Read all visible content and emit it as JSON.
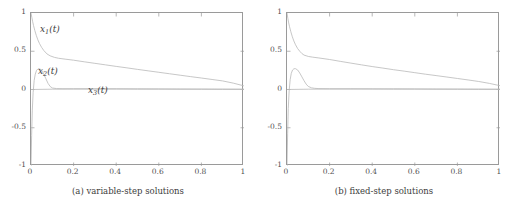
{
  "figure": {
    "background": "#ffffff",
    "axis_color": "#9a9a9a",
    "curve_color": "#b9b9b9",
    "text_color": "#3d3d3d"
  },
  "panels": [
    {
      "id": "panel-a",
      "caption": "(a) variable-step solutions",
      "annotations": [
        {
          "name": "curve-label-x1",
          "base": "x",
          "sub": "1",
          "tail": "(t)",
          "left": 40,
          "top": 24
        },
        {
          "name": "curve-label-x2",
          "base": "x",
          "sub": "2",
          "tail": "(t)",
          "left": 38,
          "top": 66
        },
        {
          "name": "curve-label-x3",
          "base": "x",
          "sub": "3",
          "tail": "(t)",
          "left": 88,
          "top": 85
        }
      ]
    },
    {
      "id": "panel-b",
      "caption": "(b) fixed-step solutions",
      "annotations": []
    }
  ],
  "axes": {
    "xlabel": "",
    "ylabel": "",
    "xlim": [
      0,
      1
    ],
    "ylim": [
      -1,
      1
    ],
    "xticks": [
      "0",
      "0.2",
      "0.4",
      "0.6",
      "0.8",
      "1"
    ],
    "xtick_values": [
      0,
      0.2,
      0.4,
      0.6,
      0.8,
      1
    ],
    "yticks": [
      "1",
      "0.5",
      "0",
      "-0.5",
      "-1"
    ],
    "ytick_values": [
      1,
      0.5,
      0,
      -0.5,
      -1
    ],
    "grid": false,
    "legend": "none"
  },
  "chart_data": [
    {
      "type": "line",
      "title": "(a) variable-step solutions",
      "xlabel": "",
      "ylabel": "",
      "xlim": [
        0,
        1
      ],
      "ylim": [
        -1,
        1
      ],
      "xticks": [
        0,
        0.2,
        0.4,
        0.6,
        0.8,
        1
      ],
      "yticks": [
        -1,
        -0.5,
        0,
        0.5,
        1
      ],
      "grid": false,
      "legend": "inline-labels",
      "series": [
        {
          "name": "x1(t)",
          "x": [
            0,
            0.004,
            0.008,
            0.012,
            0.018,
            0.025,
            0.032,
            0.04,
            0.05,
            0.06,
            0.075,
            0.09,
            0.11,
            0.13,
            0.16,
            0.2,
            0.25,
            0.3,
            0.35,
            0.4,
            0.45,
            0.5,
            0.55,
            0.6,
            0.65,
            0.7,
            0.75,
            0.8,
            0.85,
            0.9,
            0.95,
            1
          ],
          "y": [
            1.0,
            0.94,
            0.885,
            0.835,
            0.77,
            0.705,
            0.65,
            0.6,
            0.55,
            0.51,
            0.465,
            0.44,
            0.42,
            0.408,
            0.397,
            0.383,
            0.362,
            0.342,
            0.322,
            0.302,
            0.283,
            0.263,
            0.244,
            0.225,
            0.206,
            0.187,
            0.168,
            0.15,
            0.131,
            0.112,
            0.083,
            0.047
          ]
        },
        {
          "name": "x2(t)",
          "x": [
            0,
            0.003,
            0.006,
            0.01,
            0.015,
            0.02,
            0.026,
            0.033,
            0.04,
            0.045,
            0.05,
            0.06,
            0.07,
            0.08,
            0.09,
            0.1,
            0.12,
            0.15,
            0.2,
            0.3,
            0.4,
            0.5,
            0.6,
            0.7,
            0.8,
            0.9,
            1
          ],
          "y": [
            -1.0,
            -0.6,
            -0.28,
            -0.04,
            0.12,
            0.2,
            0.25,
            0.27,
            0.27,
            0.265,
            0.25,
            0.2,
            0.14,
            0.08,
            0.04,
            0.02,
            0.012,
            0.01,
            0.01,
            0.01,
            0.01,
            0.009,
            0.008,
            0.007,
            0.006,
            0.005,
            0.004
          ]
        },
        {
          "name": "x3(t)",
          "x": [
            0,
            0.1,
            0.2,
            0.3,
            0.4,
            0.5,
            0.6,
            0.7,
            0.8,
            0.9,
            1
          ],
          "y": [
            0.0,
            0.004,
            0.005,
            0.005,
            0.005,
            0.004,
            0.004,
            0.003,
            0.003,
            0.002,
            0.002
          ]
        }
      ]
    },
    {
      "type": "line",
      "title": "(b) fixed-step solutions",
      "xlabel": "",
      "ylabel": "",
      "xlim": [
        0,
        1
      ],
      "ylim": [
        -1,
        1
      ],
      "xticks": [
        0,
        0.2,
        0.4,
        0.6,
        0.8,
        1
      ],
      "yticks": [
        -1,
        -0.5,
        0,
        0.5,
        1
      ],
      "grid": false,
      "legend": "none",
      "series": [
        {
          "name": "x1(t)",
          "x": [
            0,
            0.004,
            0.008,
            0.012,
            0.018,
            0.025,
            0.032,
            0.04,
            0.05,
            0.06,
            0.07,
            0.08,
            0.1,
            0.12,
            0.15,
            0.2,
            0.25,
            0.3,
            0.35,
            0.4,
            0.45,
            0.5,
            0.55,
            0.6,
            0.65,
            0.7,
            0.75,
            0.8,
            0.85,
            0.9,
            0.95,
            1
          ],
          "y": [
            1.0,
            0.93,
            0.87,
            0.82,
            0.755,
            0.69,
            0.635,
            0.585,
            0.535,
            0.5,
            0.47,
            0.45,
            0.432,
            0.423,
            0.412,
            0.392,
            0.368,
            0.345,
            0.322,
            0.3,
            0.28,
            0.259,
            0.24,
            0.22,
            0.2,
            0.182,
            0.163,
            0.144,
            0.125,
            0.105,
            0.08,
            0.05
          ]
        },
        {
          "name": "x2(t)",
          "x": [
            0,
            0.003,
            0.006,
            0.01,
            0.015,
            0.02,
            0.026,
            0.033,
            0.04,
            0.05,
            0.06,
            0.07,
            0.08,
            0.09,
            0.1,
            0.115,
            0.13,
            0.15,
            0.2,
            0.3,
            0.4,
            0.5,
            0.6,
            0.7,
            0.8,
            0.9,
            1
          ],
          "y": [
            -1.0,
            -0.58,
            -0.25,
            -0.02,
            0.13,
            0.21,
            0.255,
            0.272,
            0.272,
            0.255,
            0.215,
            0.165,
            0.115,
            0.07,
            0.04,
            0.022,
            0.015,
            0.012,
            0.01,
            0.01,
            0.009,
            0.009,
            0.008,
            0.007,
            0.006,
            0.005,
            0.004
          ]
        },
        {
          "name": "x3(t)",
          "x": [
            0,
            0.1,
            0.2,
            0.3,
            0.4,
            0.5,
            0.6,
            0.7,
            0.8,
            0.9,
            1
          ],
          "y": [
            0.0,
            0.004,
            0.005,
            0.005,
            0.005,
            0.004,
            0.004,
            0.003,
            0.003,
            0.002,
            0.002
          ]
        }
      ]
    }
  ]
}
